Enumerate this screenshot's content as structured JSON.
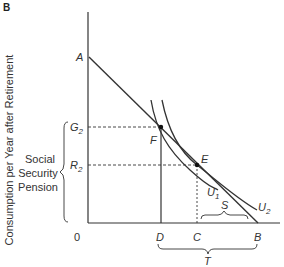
{
  "panel_label": "B",
  "y_axis_label": "Consumption per Year after Retirement",
  "side_label": [
    "Social",
    "Security",
    "Pension"
  ],
  "origin": "0",
  "points": {
    "A": "A",
    "F": "F",
    "E": "E",
    "G2": {
      "main": "G",
      "sub": "2"
    },
    "R2": {
      "main": "R",
      "sub": "2"
    },
    "D": "D",
    "C": "C",
    "B": "B"
  },
  "curves": {
    "U1": {
      "main": "U",
      "sub": "1"
    },
    "U2": {
      "main": "U",
      "sub": "2"
    }
  },
  "braces": {
    "S": "S",
    "T": "T"
  },
  "colors": {
    "line": "#333333",
    "background": "#ffffff"
  }
}
